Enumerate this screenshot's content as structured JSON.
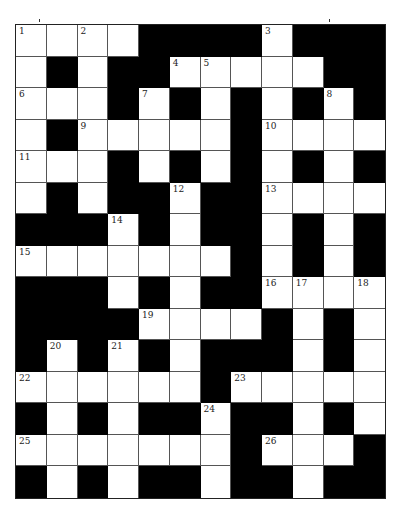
{
  "puzzle": {
    "rows": 15,
    "cols": 12,
    "layout": [
      "WWWWBBBBWBBB",
      "WBWBBWWWWWBB",
      "WWWBWBWBWBWB",
      "WBWWWWWBWWWW",
      "WWWBWBWBWBWB",
      "WBWBBWBBWWWW",
      "BBBWBWBBWBWB",
      "WWWWWWWBWBWB",
      "BBBWBWBBWWWW",
      "BBBBWWWWBWBW",
      "BWBWBWBBBWBW",
      "WWWWWWBWWWWW",
      "BWBWBBWBBWBW",
      "WWWWWWWBWWWB",
      "BWBWBBWBBWBB"
    ],
    "numbers": [
      {
        "r": 0,
        "c": 0,
        "n": "1"
      },
      {
        "r": 0,
        "c": 2,
        "n": "2"
      },
      {
        "r": 0,
        "c": 8,
        "n": "3"
      },
      {
        "r": 1,
        "c": 5,
        "n": "4"
      },
      {
        "r": 1,
        "c": 6,
        "n": "5"
      },
      {
        "r": 2,
        "c": 0,
        "n": "6"
      },
      {
        "r": 2,
        "c": 4,
        "n": "7"
      },
      {
        "r": 2,
        "c": 10,
        "n": "8"
      },
      {
        "r": 3,
        "c": 2,
        "n": "9"
      },
      {
        "r": 3,
        "c": 8,
        "n": "10"
      },
      {
        "r": 4,
        "c": 0,
        "n": "11"
      },
      {
        "r": 5,
        "c": 5,
        "n": "12"
      },
      {
        "r": 5,
        "c": 8,
        "n": "13"
      },
      {
        "r": 6,
        "c": 3,
        "n": "14"
      },
      {
        "r": 7,
        "c": 0,
        "n": "15"
      },
      {
        "r": 8,
        "c": 8,
        "n": "16"
      },
      {
        "r": 8,
        "c": 9,
        "n": "17"
      },
      {
        "r": 8,
        "c": 11,
        "n": "18"
      },
      {
        "r": 9,
        "c": 4,
        "n": "19"
      },
      {
        "r": 10,
        "c": 1,
        "n": "20"
      },
      {
        "r": 10,
        "c": 3,
        "n": "21"
      },
      {
        "r": 11,
        "c": 0,
        "n": "22"
      },
      {
        "r": 11,
        "c": 7,
        "n": "23"
      },
      {
        "r": 12,
        "c": 6,
        "n": "24"
      },
      {
        "r": 13,
        "c": 0,
        "n": "25"
      },
      {
        "r": 13,
        "c": 8,
        "n": "26"
      }
    ]
  }
}
